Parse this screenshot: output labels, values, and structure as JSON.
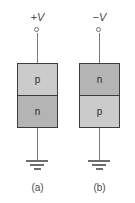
{
  "figure": {
    "background_color": "#ffffff",
    "border_color": "#3c3c3c",
    "wire_color": "#7a7a7a",
    "shade_light": "#cbcbcb",
    "shade_dark": "#b4b4b4"
  },
  "panels": [
    {
      "id": "a",
      "caption": "(a)",
      "supply_label": "+V",
      "terminal": "open-circle-terminal",
      "ground": "earth-ground-symbol",
      "regions": [
        {
          "position": "top",
          "label": "p",
          "shade": "light"
        },
        {
          "position": "bottom",
          "label": "n",
          "shade": "dark"
        }
      ]
    },
    {
      "id": "b",
      "caption": "(b)",
      "supply_label": "−V",
      "terminal": "open-circle-terminal",
      "ground": "earth-ground-symbol",
      "regions": [
        {
          "position": "top",
          "label": "n",
          "shade": "dark"
        },
        {
          "position": "bottom",
          "label": "p",
          "shade": "light"
        }
      ]
    }
  ]
}
